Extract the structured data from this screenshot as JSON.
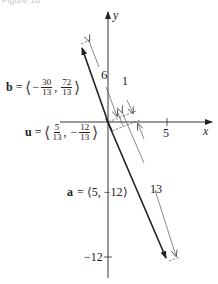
{
  "figure": {
    "caption": "Figure 16"
  },
  "axes": {
    "x_label": "x",
    "y_label": "y",
    "x_tick": "5",
    "y_tick": "−12"
  },
  "vectors": {
    "b": {
      "name": "b",
      "equals": "=",
      "open": "⟨",
      "close": "⟩",
      "sep": ",",
      "comp1_sign": "−",
      "comp1_num": "30",
      "comp1_den": "13",
      "comp2_sign": "",
      "comp2_num": "72",
      "comp2_den": "13"
    },
    "u": {
      "name": "u",
      "equals": "=",
      "open": "⟨",
      "close": "⟩",
      "sep": ",",
      "comp1_sign": "",
      "comp1_num": "5",
      "comp1_den": "13",
      "comp2_sign": "−",
      "comp2_num": "12",
      "comp2_den": "13"
    },
    "a": {
      "name": "a",
      "text": "= ⟨5, −12⟩"
    }
  },
  "dimensions": {
    "b_length": "6",
    "u_length": "1",
    "a_length": "13"
  },
  "colors": {
    "ink": "#222222",
    "axis": "#333333",
    "dim": "#555555"
  }
}
